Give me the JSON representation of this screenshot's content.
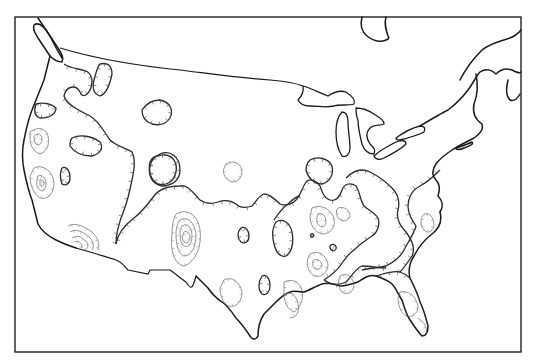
{
  "figure": {
    "title": "",
    "region": "Continental United States",
    "line_color": "#1a1a1a",
    "background_color": "#ffffff",
    "labels": []
  },
  "layers": {
    "frame": "map-frame",
    "coastline": "North American coastline",
    "international_border": "US-Canada border",
    "great_lakes": [
      "Superior",
      "Michigan",
      "Huron",
      "Erie",
      "Ontario"
    ],
    "contours": {
      "style": "hachured",
      "major": "thick closed contours with tick marks",
      "minor": "thin nested contours (concentric rings)"
    }
  }
}
